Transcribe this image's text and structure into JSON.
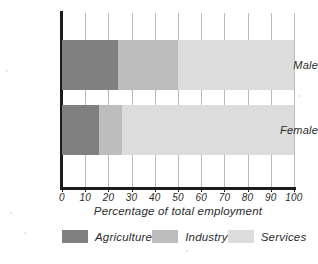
{
  "chart_data": {
    "type": "bar",
    "orientation": "horizontal",
    "stacked": true,
    "title": "",
    "xlabel": "Percentage of total employment",
    "ylabel": "",
    "categories": [
      "Male",
      "Female"
    ],
    "series": [
      {
        "name": "Agriculture",
        "color": "#808080",
        "values": [
          24,
          16
        ]
      },
      {
        "name": "Industry",
        "color": "#bdbdbd",
        "values": [
          26,
          10
        ]
      },
      {
        "name": "Services",
        "color": "#dcdcdc",
        "values": [
          50,
          74
        ]
      }
    ],
    "xlim": [
      0,
      100
    ],
    "xticks": [
      0,
      10,
      20,
      30,
      40,
      50,
      60,
      70,
      80,
      90,
      100
    ],
    "xtick_labels": [
      "0",
      "10",
      "20",
      "30",
      "40",
      "50",
      "60",
      "70",
      "80",
      "90",
      "100"
    ],
    "grid": "vertical",
    "legend_position": "bottom"
  },
  "axis": {
    "x_title": "Percentage of total employment",
    "ticks": [
      {
        "value": 0,
        "label": "0"
      },
      {
        "value": 10,
        "label": "10"
      },
      {
        "value": 20,
        "label": "20"
      },
      {
        "value": 30,
        "label": "30"
      },
      {
        "value": 40,
        "label": "40"
      },
      {
        "value": 50,
        "label": "50"
      },
      {
        "value": 60,
        "label": "60"
      },
      {
        "value": 70,
        "label": "70"
      },
      {
        "value": 80,
        "label": "80"
      },
      {
        "value": 90,
        "label": "90"
      },
      {
        "value": 100,
        "label": "100"
      }
    ]
  },
  "categories": [
    {
      "label": "Male"
    },
    {
      "label": "Female"
    }
  ],
  "legend": {
    "items": [
      {
        "label": "Agriculture",
        "color": "#808080"
      },
      {
        "label": "Industry",
        "color": "#bdbdbd"
      },
      {
        "label": "Services",
        "color": "#dcdcdc"
      }
    ]
  },
  "colors": {
    "agriculture": "#808080",
    "industry": "#bdbdbd",
    "services": "#dcdcdc",
    "axis": "#1c1c1c",
    "gridline": "#b9b9b9",
    "text": "#2b2b2b",
    "background": "#ffffff"
  }
}
